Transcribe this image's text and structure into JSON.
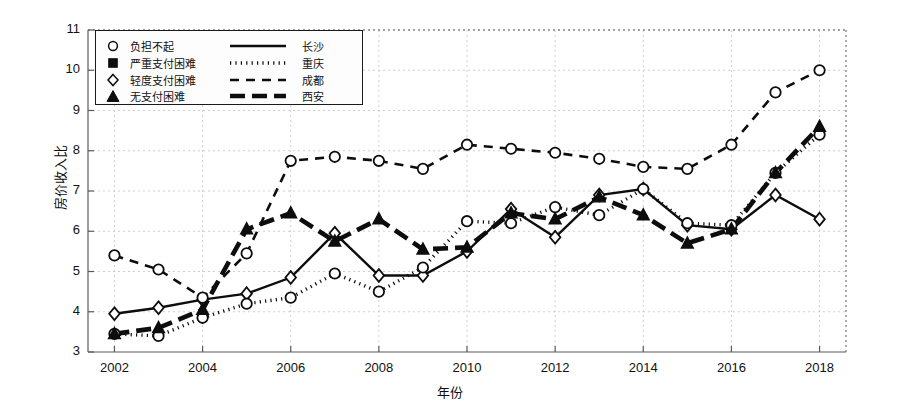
{
  "chart_data": {
    "type": "line",
    "title": "",
    "xlabel": "年份",
    "ylabel": "房价收入比",
    "xlim": [
      2001.4,
      2018.6
    ],
    "ylim": [
      3,
      11
    ],
    "xticks": [
      2002,
      2004,
      2006,
      2008,
      2010,
      2012,
      2014,
      2016,
      2018
    ],
    "yticks": [
      3,
      4,
      5,
      6,
      7,
      8,
      9,
      10,
      11
    ],
    "grid": true,
    "legend_position": "upper-left",
    "x": [
      2002,
      2003,
      2004,
      2005,
      2006,
      2007,
      2008,
      2009,
      2010,
      2011,
      2012,
      2013,
      2014,
      2015,
      2016,
      2017,
      2018
    ],
    "series": [
      {
        "name": "长沙",
        "line_style": "solid",
        "marker": "diamond",
        "marker_label": "轻度支付困难",
        "values": [
          3.95,
          4.1,
          4.3,
          4.45,
          4.85,
          5.95,
          4.9,
          4.9,
          5.5,
          6.55,
          5.85,
          6.9,
          7.05,
          6.15,
          6.05,
          6.9,
          6.3
        ]
      },
      {
        "name": "重庆",
        "line_style": "dotted",
        "marker": "circle",
        "marker_label": "负担不起",
        "values": [
          3.45,
          3.4,
          3.85,
          4.2,
          4.35,
          4.95,
          4.5,
          5.1,
          6.25,
          6.2,
          6.6,
          6.4,
          7.05,
          6.2,
          6.15,
          7.45,
          8.4
        ]
      },
      {
        "name": "成都",
        "line_style": "dashed",
        "marker": "circle-open",
        "marker_label": "负担不起",
        "values": [
          5.4,
          5.05,
          4.35,
          5.45,
          7.75,
          7.85,
          7.75,
          7.55,
          8.15,
          8.05,
          7.95,
          7.8,
          7.6,
          7.55,
          8.15,
          9.45,
          10.0
        ]
      },
      {
        "name": "西安",
        "line_style": "thick-dash",
        "marker": "triangle",
        "marker_label": "无支付困难",
        "values": [
          3.45,
          3.6,
          4.05,
          6.05,
          6.45,
          5.75,
          6.3,
          5.55,
          5.6,
          6.45,
          6.3,
          6.85,
          6.4,
          5.7,
          6.05,
          7.45,
          8.6
        ]
      }
    ],
    "legend": {
      "marker_entries": [
        {
          "marker": "circle-open",
          "label": "负担不起"
        },
        {
          "marker": "square-filled",
          "label": "严重支付困难"
        },
        {
          "marker": "diamond-open",
          "label": "轻度支付困难"
        },
        {
          "marker": "triangle-filled",
          "label": "无支付困难"
        }
      ],
      "line_entries": [
        {
          "style": "solid",
          "label": "长沙"
        },
        {
          "style": "dotted",
          "label": "重庆"
        },
        {
          "style": "dashed",
          "label": "成都"
        },
        {
          "style": "thick-dash",
          "label": "西安"
        }
      ]
    }
  },
  "axis": {
    "ytick_labels": [
      "11",
      "10",
      "9",
      "8",
      "7",
      "6",
      "5",
      "4",
      "3"
    ],
    "xtick_labels": [
      "2002",
      "2004",
      "2006",
      "2008",
      "2010",
      "2012",
      "2014",
      "2016",
      "2018"
    ],
    "ylabel": "房价收入比",
    "xlabel": "年份"
  },
  "colors": {
    "line": "#0d0d0d",
    "grid": "#c9c9c9",
    "axis": "#5a5a5a",
    "background": "#ffffff"
  }
}
